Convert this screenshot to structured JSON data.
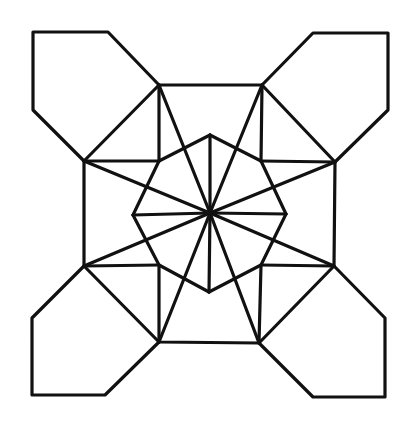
{
  "diagram": {
    "type": "geometric-tiling",
    "stroke_color": "#111111",
    "background_color": "#ffffff",
    "center": [
      210,
      213
    ],
    "octagon": [
      [
        159,
        85
      ],
      [
        262,
        85
      ],
      [
        335,
        162
      ],
      [
        334,
        266
      ],
      [
        259,
        343
      ],
      [
        159,
        342
      ],
      [
        84,
        266
      ],
      [
        84,
        161
      ]
    ],
    "inner_square": [
      [
        159,
        161
      ],
      [
        261,
        161
      ],
      [
        261,
        265
      ],
      [
        159,
        265
      ]
    ],
    "star_tips": {
      "top": [
        210,
        135
      ],
      "right": [
        286,
        214
      ],
      "bottom": [
        209,
        292
      ],
      "left": [
        133,
        215
      ]
    },
    "corner_pieces": {
      "top_left": [
        [
          159,
          85
        ],
        [
          108,
          32
        ],
        [
          33,
          32
        ],
        [
          33,
          110
        ],
        [
          84,
          161
        ]
      ],
      "top_right": [
        [
          262,
          85
        ],
        [
          313,
          33
        ],
        [
          388,
          33
        ],
        [
          388,
          110
        ],
        [
          335,
          162
        ]
      ],
      "bottom_right": [
        [
          334,
          266
        ],
        [
          385,
          318
        ],
        [
          385,
          397
        ],
        [
          313,
          397
        ],
        [
          259,
          343
        ]
      ],
      "bottom_left": [
        [
          84,
          266
        ],
        [
          32,
          318
        ],
        [
          32,
          395
        ],
        [
          105,
          395
        ],
        [
          159,
          342
        ]
      ]
    }
  }
}
